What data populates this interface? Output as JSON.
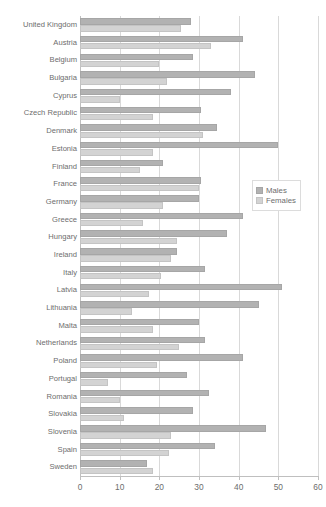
{
  "chart_data": {
    "type": "bar",
    "orientation": "horizontal",
    "title": "",
    "xlabel": "",
    "ylabel": "",
    "xlim": [
      0,
      60
    ],
    "xticks": [
      0,
      10,
      20,
      30,
      40,
      50,
      60
    ],
    "grid": true,
    "legend_position": "right",
    "categories": [
      "United Kingdom",
      "Austria",
      "Belgium",
      "Bulgaria",
      "Cyprus",
      "Czech Republic",
      "Denmark",
      "Estonia",
      "Finland",
      "France",
      "Germany",
      "Greece",
      "Hungary",
      "Ireland",
      "Italy",
      "Latvia",
      "Lithuania",
      "Malta",
      "Netherlands",
      "Poland",
      "Portugal",
      "Romania",
      "Slovakia",
      "Slovenia",
      "Spain",
      "Sweden"
    ],
    "series": [
      {
        "name": "Males",
        "color": "#b2b2b2",
        "values": [
          28.0,
          41.0,
          28.5,
          44.0,
          38.0,
          30.5,
          34.5,
          50.0,
          21.0,
          30.5,
          30.0,
          41.0,
          37.0,
          24.5,
          31.5,
          51.0,
          45.0,
          30.0,
          31.5,
          41.0,
          27.0,
          32.5,
          28.5,
          47.0,
          34.0,
          17.0
        ]
      },
      {
        "name": "Females",
        "color": "#d3d3d3",
        "values": [
          25.5,
          33.0,
          20.0,
          22.0,
          10.0,
          18.5,
          31.0,
          18.5,
          15.0,
          30.0,
          21.0,
          16.0,
          24.5,
          23.0,
          20.5,
          17.5,
          13.0,
          18.5,
          25.0,
          19.5,
          7.0,
          10.0,
          11.0,
          23.0,
          22.5,
          18.5
        ]
      }
    ]
  },
  "legend": {
    "items": [
      {
        "label": "Males"
      },
      {
        "label": "Females"
      }
    ]
  }
}
